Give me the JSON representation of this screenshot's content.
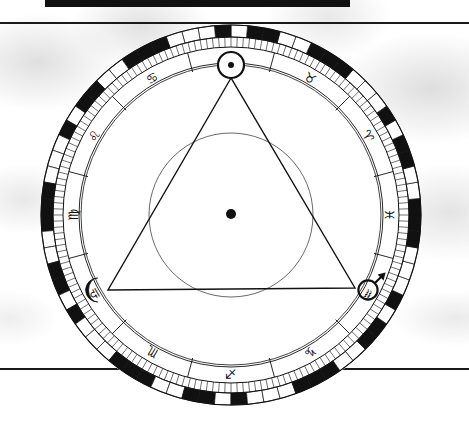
{
  "document": {
    "type": "astrological-natal-chart-wheel",
    "background_color": "#ffffff",
    "ink_color": "#111111",
    "page_width": 469,
    "page_height": 442,
    "top_black_bar": {
      "x": 45,
      "y": 0,
      "width": 305,
      "height": 7
    },
    "rules": [
      {
        "name": "top-rule",
        "x": 0,
        "y": 22,
        "width": 469,
        "height": 2
      },
      {
        "name": "bottom-rule",
        "x": 0,
        "y": 368,
        "width": 469,
        "height": 2
      }
    ]
  },
  "wheel": {
    "center_x": 231,
    "center_y": 215,
    "outer_ring_radius": 190,
    "degree_band_outer_radius": 190,
    "degree_band_inner_radius": 178,
    "tick_band_outer_radius": 178,
    "tick_band_inner_radius": 168,
    "sign_band_outer_radius": 168,
    "sign_band_inner_radius": 152,
    "house_ring_radius": 150,
    "inner_circle_radius": 82,
    "center_dot_radius": 5,
    "degree_segments": 72,
    "tick_marks": 180
  },
  "zodiac_signs": [
    {
      "name": "gemini",
      "glyph": "♊",
      "label": "Gemini",
      "angle_deg": 90,
      "label_angle_deg": 90
    },
    {
      "name": "cancer",
      "glyph": "♋",
      "label": "Cancer",
      "angle_deg": 120,
      "label_angle_deg": 120
    },
    {
      "name": "leo",
      "glyph": "♌",
      "label": "Leo",
      "angle_deg": 150,
      "label_angle_deg": 150
    },
    {
      "name": "virgo",
      "glyph": "♍",
      "label": "Virgo",
      "angle_deg": 180,
      "label_angle_deg": 180
    },
    {
      "name": "libra",
      "glyph": "♎",
      "label": "Libra",
      "angle_deg": 210,
      "label_angle_deg": 210
    },
    {
      "name": "scorpio",
      "glyph": "♏",
      "label": "Scorpio",
      "angle_deg": 240,
      "label_angle_deg": 240
    },
    {
      "name": "sagittarius",
      "glyph": "♐",
      "label": "Sagittarius",
      "angle_deg": 270,
      "label_angle_deg": 270
    },
    {
      "name": "capricorn",
      "glyph": "♑",
      "label": "Capricorn",
      "angle_deg": 300,
      "label_angle_deg": 300
    },
    {
      "name": "aquarius",
      "glyph": "♒",
      "label": "Aquarius",
      "angle_deg": 330,
      "label_angle_deg": 330
    },
    {
      "name": "pisces",
      "glyph": "♓",
      "label": "Pisces",
      "angle_deg": 0,
      "label_angle_deg": 0
    },
    {
      "name": "aries",
      "glyph": "♈",
      "label": "Aries",
      "angle_deg": 30,
      "label_angle_deg": 30
    },
    {
      "name": "taurus",
      "glyph": "♉",
      "label": "Taurus",
      "angle_deg": 60,
      "label_angle_deg": 60
    }
  ],
  "cusp_angles_deg": [
    75,
    105,
    135,
    165,
    195,
    225,
    255,
    285,
    315,
    345,
    15,
    45
  ],
  "planets": [
    {
      "name": "sun",
      "glyph": "☉",
      "label": "Sun",
      "x": 231,
      "y": 65,
      "symbol_radius": 13,
      "inner_dot_radius": 3
    },
    {
      "name": "moon",
      "glyph": "☽",
      "label": "Moon",
      "x": 95,
      "y": 290,
      "symbol_radius": 12
    },
    {
      "name": "mars",
      "glyph": "♂",
      "label": "Mars",
      "x": 368,
      "y": 288,
      "symbol_radius": 12
    }
  ],
  "aspect_triangle": {
    "name": "grand-trine",
    "vertices": [
      {
        "planet": "sun",
        "x": 231,
        "y": 78
      },
      {
        "planet": "moon",
        "x": 108,
        "y": 290
      },
      {
        "planet": "mars",
        "x": 355,
        "y": 288
      }
    ],
    "stroke_width": 1.4
  },
  "center_body": {
    "name": "earth-center-point",
    "x": 231,
    "y": 214,
    "radius": 5
  }
}
